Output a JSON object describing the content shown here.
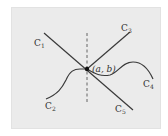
{
  "diagram": {
    "type": "curves-through-point",
    "background_color": "#ebebeb",
    "stroke_color": "#3a3a3a",
    "point": {
      "label": "(a, b)",
      "a": "a",
      "b": "b"
    },
    "curves": [
      {
        "id": "C1",
        "base": "C",
        "sub": "1",
        "kind": "line"
      },
      {
        "id": "C2",
        "base": "C",
        "sub": "2",
        "kind": "curve"
      },
      {
        "id": "C3",
        "base": "C",
        "sub": "3",
        "kind": "line"
      },
      {
        "id": "C4",
        "base": "C",
        "sub": "4",
        "kind": "curve"
      },
      {
        "id": "C5",
        "base": "C",
        "sub": "5",
        "kind": "line"
      }
    ],
    "vertical_line": {
      "style": "dashed"
    }
  }
}
